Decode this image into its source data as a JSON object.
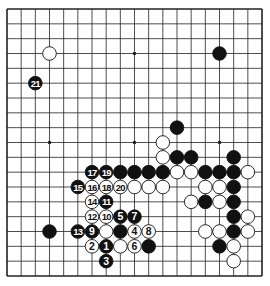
{
  "diagram": {
    "type": "go-board",
    "size": 19,
    "colors": {
      "line": "#222222",
      "black": "#111111",
      "white": "#ffffff",
      "background": "#ffffff"
    },
    "star_points": [
      [
        3,
        3
      ],
      [
        9,
        3
      ],
      [
        15,
        3
      ],
      [
        3,
        9
      ],
      [
        9,
        9
      ],
      [
        15,
        9
      ],
      [
        3,
        15
      ],
      [
        9,
        15
      ],
      [
        15,
        15
      ]
    ],
    "stones": [
      {
        "col": 3,
        "row": 3,
        "color": "white"
      },
      {
        "col": 15,
        "row": 3,
        "color": "black"
      },
      {
        "col": 12,
        "row": 8,
        "color": "black"
      },
      {
        "col": 11,
        "row": 9,
        "color": "white"
      },
      {
        "col": 11,
        "row": 10,
        "color": "white"
      },
      {
        "col": 12,
        "row": 10,
        "color": "black"
      },
      {
        "col": 13,
        "row": 10,
        "color": "black"
      },
      {
        "col": 16,
        "row": 10,
        "color": "black"
      },
      {
        "col": 8,
        "row": 11,
        "color": "black"
      },
      {
        "col": 9,
        "row": 11,
        "color": "black"
      },
      {
        "col": 10,
        "row": 11,
        "color": "black"
      },
      {
        "col": 11,
        "row": 11,
        "color": "black"
      },
      {
        "col": 12,
        "row": 11,
        "color": "white"
      },
      {
        "col": 13,
        "row": 11,
        "color": "white"
      },
      {
        "col": 14,
        "row": 11,
        "color": "black"
      },
      {
        "col": 15,
        "row": 11,
        "color": "black"
      },
      {
        "col": 16,
        "row": 11,
        "color": "black"
      },
      {
        "col": 17,
        "row": 11,
        "color": "white"
      },
      {
        "col": 9,
        "row": 12,
        "color": "white"
      },
      {
        "col": 10,
        "row": 12,
        "color": "white"
      },
      {
        "col": 11,
        "row": 12,
        "color": "white"
      },
      {
        "col": 14,
        "row": 12,
        "color": "white"
      },
      {
        "col": 15,
        "row": 12,
        "color": "white"
      },
      {
        "col": 16,
        "row": 12,
        "color": "black"
      },
      {
        "col": 13,
        "row": 13,
        "color": "white"
      },
      {
        "col": 14,
        "row": 13,
        "color": "black"
      },
      {
        "col": 15,
        "row": 13,
        "color": "white"
      },
      {
        "col": 16,
        "row": 13,
        "color": "black"
      },
      {
        "col": 16,
        "row": 14,
        "color": "black"
      },
      {
        "col": 17,
        "row": 14,
        "color": "white"
      },
      {
        "col": 3,
        "row": 15,
        "color": "black"
      },
      {
        "col": 7,
        "row": 15,
        "color": "white"
      },
      {
        "col": 8,
        "row": 15,
        "color": "black"
      },
      {
        "col": 14,
        "row": 15,
        "color": "white"
      },
      {
        "col": 15,
        "row": 15,
        "color": "white"
      },
      {
        "col": 16,
        "row": 15,
        "color": "black"
      },
      {
        "col": 17,
        "row": 15,
        "color": "white"
      },
      {
        "col": 8,
        "row": 16,
        "color": "white"
      },
      {
        "col": 10,
        "row": 16,
        "color": "black"
      },
      {
        "col": 15,
        "row": 16,
        "color": "black"
      },
      {
        "col": 16,
        "row": 16,
        "color": "white"
      },
      {
        "col": 16,
        "row": 17,
        "color": "white"
      }
    ],
    "moves": [
      {
        "n": 1,
        "col": 7,
        "row": 16,
        "color": "black"
      },
      {
        "n": 2,
        "col": 6,
        "row": 16,
        "color": "white"
      },
      {
        "n": 3,
        "col": 7,
        "row": 17,
        "color": "black"
      },
      {
        "n": 4,
        "col": 9,
        "row": 15,
        "color": "white"
      },
      {
        "n": 5,
        "col": 8,
        "row": 14,
        "color": "black"
      },
      {
        "n": 6,
        "col": 9,
        "row": 16,
        "color": "white"
      },
      {
        "n": 7,
        "col": 9,
        "row": 14,
        "color": "black"
      },
      {
        "n": 8,
        "col": 10,
        "row": 15,
        "color": "white"
      },
      {
        "n": 9,
        "col": 6,
        "row": 15,
        "color": "black"
      },
      {
        "n": 10,
        "col": 7,
        "row": 14,
        "color": "white"
      },
      {
        "n": 11,
        "col": 7,
        "row": 13,
        "color": "black"
      },
      {
        "n": 12,
        "col": 6,
        "row": 14,
        "color": "white"
      },
      {
        "n": 13,
        "col": 5,
        "row": 15,
        "color": "black"
      },
      {
        "n": 14,
        "col": 6,
        "row": 13,
        "color": "white"
      },
      {
        "n": 15,
        "col": 5,
        "row": 12,
        "color": "black"
      },
      {
        "n": 16,
        "col": 6,
        "row": 12,
        "color": "white"
      },
      {
        "n": 17,
        "col": 6,
        "row": 11,
        "color": "black"
      },
      {
        "n": 18,
        "col": 7,
        "row": 12,
        "color": "white"
      },
      {
        "n": 19,
        "col": 7,
        "row": 11,
        "color": "black"
      },
      {
        "n": 20,
        "col": 8,
        "row": 12,
        "color": "white"
      },
      {
        "n": 21,
        "col": 2,
        "row": 5,
        "color": "black"
      }
    ]
  }
}
